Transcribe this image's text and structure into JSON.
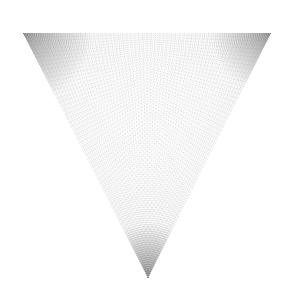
{
  "figure": {
    "shape": "inverted-triangle",
    "vertices": {
      "top_left": [
        23,
        33
      ],
      "top_right": [
        271,
        33
      ],
      "bottom": [
        148,
        278
      ]
    },
    "colors": {
      "background": "#ffffff",
      "line": "#6e6e6e",
      "corner_shade": "#8a8a8a"
    },
    "line_families": 3,
    "lines_per_family": 60
  }
}
